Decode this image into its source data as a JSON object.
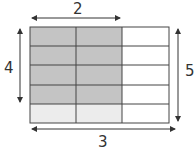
{
  "diagram": {
    "labels": {
      "top": "2",
      "left": "4",
      "right": "5",
      "bottom": "3"
    },
    "grid": {
      "columns": 3,
      "rows": 5,
      "shaded_dark": {
        "columns": 2,
        "rows": 4
      },
      "shaded_light": {
        "columns": 2,
        "rows": 1
      }
    },
    "colors": {
      "dark_shade": "#c4c4c4",
      "light_shade": "#ececec",
      "line": "#444444",
      "arrow": "#333333"
    }
  }
}
